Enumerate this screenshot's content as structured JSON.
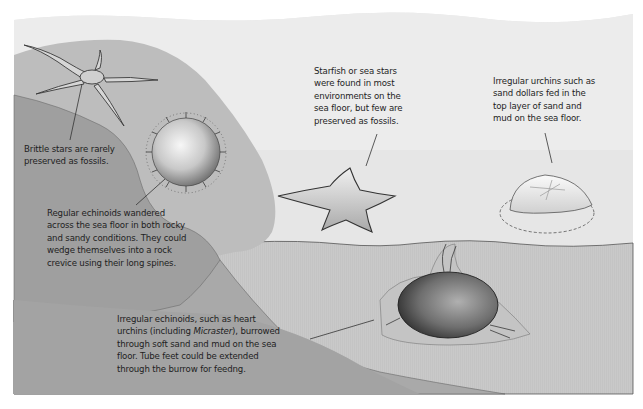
{
  "figure": {
    "type": "illustration",
    "colors": {
      "background": "#ffffff",
      "water_top": "#ececec",
      "water": "#e4e4e4",
      "shelf_light": "#bdbdbd",
      "rock_dark": "#9e9e9e",
      "sea_floor": "#c9c9c9",
      "burrow_sediment": "#a8a8a8",
      "line": "#333333",
      "text": "#1e1e1e"
    }
  },
  "annotations": {
    "brittle_star": {
      "lines": [
        "Brittle stars are rarely",
        "preserved as fossils."
      ]
    },
    "regular_echinoid": {
      "lines": [
        "Regular echinoids wandered",
        "across the sea floor in both rocky",
        "and sandy conditions. They could",
        "wedge themselves into a rock",
        "crevice using their long spines."
      ]
    },
    "starfish": {
      "lines": [
        "Starfish or sea stars",
        "were found in most",
        "environments on the",
        "sea floor, but few are",
        "preserved as fossils."
      ]
    },
    "sand_dollar": {
      "lines": [
        "Irregular urchins such as",
        "sand dollars fed in the",
        "top layer of sand and",
        "mud on the sea floor."
      ]
    },
    "heart_urchin": {
      "line1": "Irregular echinoids, such as heart",
      "line2_pre": "urchins (including ",
      "line2_italic": "Micraster",
      "line2_post": "), burrowed",
      "line3": "through soft sand and mud on the sea",
      "line4": "floor. Tube feet could be extended",
      "line5": "through the burrow for feedng."
    }
  },
  "organisms": [
    {
      "name": "brittle-star"
    },
    {
      "name": "regular-echinoid"
    },
    {
      "name": "starfish"
    },
    {
      "name": "sand-dollar"
    },
    {
      "name": "heart-urchin-micraster"
    }
  ]
}
